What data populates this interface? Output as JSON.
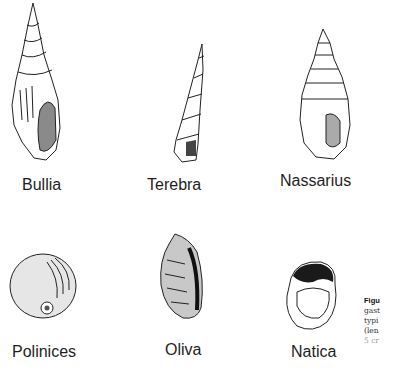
{
  "figure": {
    "shells": [
      {
        "name": "Bullia"
      },
      {
        "name": "Terebra"
      },
      {
        "name": "Nassarius"
      },
      {
        "name": "Polinices"
      },
      {
        "name": "Oliva"
      },
      {
        "name": "Natica"
      }
    ],
    "caption_fragment": [
      "Figu",
      "gast",
      "typi",
      "(len",
      "5 cr"
    ]
  }
}
